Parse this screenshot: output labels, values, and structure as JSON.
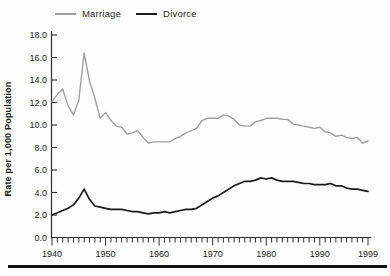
{
  "legend": {
    "items": [
      {
        "label": "Marriage",
        "color": "#a0a0a0"
      },
      {
        "label": "Divorce",
        "color": "#1c1c1c"
      }
    ]
  },
  "y_axis": {
    "title": "Rate per 1,000 Population",
    "tick_labels": [
      "0.0",
      "2.0",
      "4.0",
      "6.0",
      "8.0",
      "10.0",
      "12.0",
      "14.0",
      "16.0",
      "18.0"
    ],
    "min": 0,
    "max": 18,
    "step": 2
  },
  "x_axis": {
    "tick_labels": [
      "1940",
      "1950",
      "1960",
      "1970",
      "1980",
      "1990",
      "1999"
    ],
    "start": 1940,
    "end": 1999,
    "minor_tick_every": 1
  },
  "colors": {
    "axis": "#2e2e2e",
    "tick_text": "#222222",
    "bottom_rule": "#111111"
  },
  "chart_data": {
    "type": "line",
    "title": "",
    "xlabel": "",
    "ylabel": "Rate per 1,000 Population",
    "ylim": [
      0,
      18
    ],
    "xlim": [
      1940,
      1999
    ],
    "grid": false,
    "legend_position": "top",
    "x": [
      1940,
      1941,
      1942,
      1943,
      1944,
      1945,
      1946,
      1947,
      1948,
      1949,
      1950,
      1951,
      1952,
      1953,
      1954,
      1955,
      1956,
      1957,
      1958,
      1959,
      1960,
      1961,
      1962,
      1963,
      1964,
      1965,
      1966,
      1967,
      1968,
      1969,
      1970,
      1971,
      1972,
      1973,
      1974,
      1975,
      1976,
      1977,
      1978,
      1979,
      1980,
      1981,
      1982,
      1983,
      1984,
      1985,
      1986,
      1987,
      1988,
      1989,
      1990,
      1991,
      1992,
      1993,
      1994,
      1995,
      1996,
      1997,
      1998,
      1999
    ],
    "series": [
      {
        "name": "Marriage",
        "color": "#a0a0a0",
        "width": 1.4,
        "values": [
          12.1,
          12.7,
          13.2,
          11.7,
          10.9,
          12.2,
          16.4,
          13.9,
          12.4,
          10.6,
          11.1,
          10.4,
          9.9,
          9.8,
          9.2,
          9.3,
          9.5,
          8.9,
          8.4,
          8.5,
          8.5,
          8.5,
          8.5,
          8.8,
          9.0,
          9.3,
          9.5,
          9.7,
          10.4,
          10.6,
          10.6,
          10.6,
          10.9,
          10.8,
          10.5,
          10.0,
          9.9,
          9.9,
          10.3,
          10.4,
          10.6,
          10.6,
          10.6,
          10.5,
          10.5,
          10.1,
          10.0,
          9.9,
          9.8,
          9.7,
          9.8,
          9.4,
          9.3,
          9.0,
          9.1,
          8.9,
          8.8,
          8.9,
          8.4,
          8.6
        ]
      },
      {
        "name": "Divorce",
        "color": "#1c1c1c",
        "width": 1.7,
        "values": [
          2.0,
          2.2,
          2.4,
          2.6,
          2.9,
          3.5,
          4.3,
          3.4,
          2.8,
          2.7,
          2.6,
          2.5,
          2.5,
          2.5,
          2.4,
          2.3,
          2.3,
          2.2,
          2.1,
          2.2,
          2.2,
          2.3,
          2.2,
          2.3,
          2.4,
          2.5,
          2.5,
          2.6,
          2.9,
          3.2,
          3.5,
          3.7,
          4.0,
          4.3,
          4.6,
          4.8,
          5.0,
          5.0,
          5.1,
          5.3,
          5.2,
          5.3,
          5.1,
          5.0,
          5.0,
          5.0,
          4.9,
          4.8,
          4.8,
          4.7,
          4.7,
          4.7,
          4.8,
          4.6,
          4.6,
          4.4,
          4.3,
          4.3,
          4.2,
          4.1
        ]
      }
    ]
  }
}
